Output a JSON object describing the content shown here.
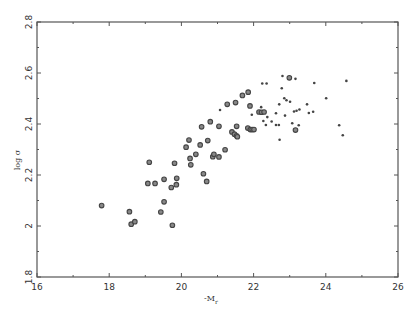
{
  "chart_data": {
    "type": "scatter",
    "title": "",
    "xlabel": "-M_r",
    "ylabel": "log σ",
    "xlim": [
      16,
      26
    ],
    "ylim": [
      1.8,
      2.8
    ],
    "xticks": [
      16,
      18,
      20,
      22,
      24,
      26
    ],
    "yticks": [
      1.8,
      2.0,
      2.2,
      2.4,
      2.6,
      2.8
    ],
    "xtick_labels": [
      "16",
      "18",
      "20",
      "22",
      "24",
      "26"
    ],
    "ytick_labels": [
      "1.8",
      "2",
      "2.2",
      "2.4",
      "2.6",
      "2.8"
    ],
    "grid": false,
    "legend": null,
    "series": [
      {
        "name": "large-symbol galaxies",
        "marker": "open-octagon",
        "points": [
          [
            17.79,
            2.08
          ],
          [
            18.56,
            2.056
          ],
          [
            18.61,
            2.007
          ],
          [
            18.71,
            2.017
          ],
          [
            19.07,
            2.167
          ],
          [
            19.27,
            2.167
          ],
          [
            19.52,
            2.183
          ],
          [
            19.72,
            2.151
          ],
          [
            19.87,
            2.187
          ],
          [
            19.86,
            2.162
          ],
          [
            19.52,
            2.095
          ],
          [
            19.43,
            2.055
          ],
          [
            19.75,
            2.003
          ],
          [
            19.11,
            2.25
          ],
          [
            19.81,
            2.246
          ],
          [
            20.26,
            2.24
          ],
          [
            20.24,
            2.265
          ],
          [
            20.4,
            2.281
          ],
          [
            20.61,
            2.205
          ],
          [
            20.7,
            2.175
          ],
          [
            20.13,
            2.309
          ],
          [
            20.21,
            2.337
          ],
          [
            20.52,
            2.318
          ],
          [
            20.73,
            2.335
          ],
          [
            20.56,
            2.389
          ],
          [
            20.8,
            2.409
          ],
          [
            21.04,
            2.391
          ],
          [
            20.87,
            2.272
          ],
          [
            20.9,
            2.281
          ],
          [
            21.04,
            2.271
          ],
          [
            21.21,
            2.299
          ],
          [
            21.27,
            2.477
          ],
          [
            21.5,
            2.484
          ],
          [
            21.53,
            2.391
          ],
          [
            21.4,
            2.369
          ],
          [
            21.47,
            2.36
          ],
          [
            21.53,
            2.354
          ],
          [
            21.55,
            2.35
          ],
          [
            21.69,
            2.512
          ],
          [
            21.85,
            2.525
          ],
          [
            21.9,
            2.471
          ],
          [
            22.15,
            2.447
          ],
          [
            22.22,
            2.446
          ],
          [
            22.29,
            2.447
          ],
          [
            21.84,
            2.384
          ],
          [
            21.91,
            2.378
          ],
          [
            21.96,
            2.378
          ],
          [
            22.01,
            2.378
          ],
          [
            22.99,
            2.581
          ],
          [
            23.16,
            2.376
          ]
        ]
      },
      {
        "name": "small-symbol galaxies",
        "marker": "dot",
        "points": [
          [
            21.07,
            2.455
          ],
          [
            22.21,
            2.466
          ],
          [
            22.24,
            2.559
          ],
          [
            22.36,
            2.559
          ],
          [
            21.95,
            2.436
          ],
          [
            22.38,
            2.427
          ],
          [
            22.27,
            2.412
          ],
          [
            22.34,
            2.396
          ],
          [
            22.5,
            2.41
          ],
          [
            22.62,
            2.396
          ],
          [
            22.7,
            2.396
          ],
          [
            22.62,
            2.442
          ],
          [
            22.87,
            2.433
          ],
          [
            22.72,
            2.338
          ],
          [
            22.8,
            2.588
          ],
          [
            23.16,
            2.577
          ],
          [
            22.78,
            2.54
          ],
          [
            22.85,
            2.501
          ],
          [
            22.91,
            2.493
          ],
          [
            23.01,
            2.487
          ],
          [
            22.71,
            2.477
          ],
          [
            23.07,
            2.403
          ],
          [
            23.25,
            2.395
          ],
          [
            23.12,
            2.449
          ],
          [
            23.19,
            2.452
          ],
          [
            23.27,
            2.457
          ],
          [
            23.48,
            2.477
          ],
          [
            23.53,
            2.443
          ],
          [
            23.65,
            2.448
          ],
          [
            23.68,
            2.561
          ],
          [
            24.01,
            2.501
          ],
          [
            24.37,
            2.395
          ],
          [
            24.47,
            2.356
          ],
          [
            24.57,
            2.569
          ]
        ]
      }
    ]
  },
  "axes": {
    "x_label_main": "-M",
    "x_label_sub": "r",
    "y_label": "log σ"
  },
  "colors": {
    "axis": "#555555",
    "marker": "#444444",
    "background": "#ffffff"
  }
}
